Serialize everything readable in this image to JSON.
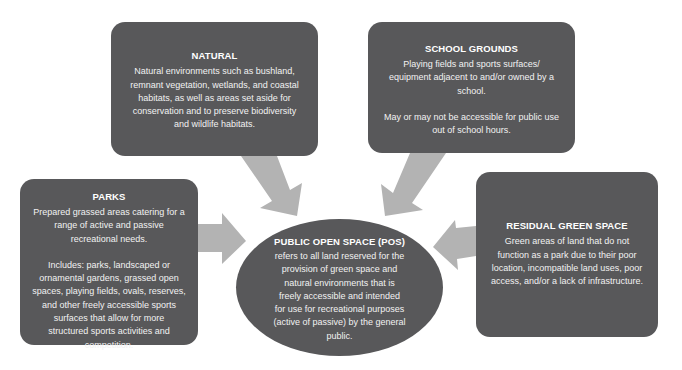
{
  "diagram": {
    "center": {
      "title": "PUBLIC OPEN SPACE (POS)",
      "text": "refers to all land reserved for the\nprovision of green space and\nnatural environments that is\nfreely accessible and intended\nfor use for recreational purposes\n(active of passive) by the general\npublic."
    },
    "natural": {
      "title": "NATURAL",
      "text": "Natural environments such as bushland,\nremnant vegetation, wetlands, and coastal\nhabitats, as well as areas set aside for\nconservation and to preserve biodiversity\nand wildlife habitats."
    },
    "school_grounds": {
      "title": "SCHOOL GROUNDS",
      "text": "Playing fields and sports surfaces/\nequipment adjacent to and/or owned by a\nschool.",
      "note": "May or may not be accessible for public use\nout of school hours."
    },
    "parks": {
      "title": "PARKS",
      "text": "Prepared grassed areas catering for a\nrange of active and passive\nrecreational needs.",
      "note": "Includes: parks, landscaped or\nornamental gardens, grassed open\nspaces, playing fields, ovals, reserves,\nand other freely accessible sports\nsurfaces that allow for more\nstructured sports activities and\ncompetition."
    },
    "residual_green_space": {
      "title": "RESIDUAL GREEN SPACE",
      "text": "Green areas of land that do not\nfunction as a park due to their poor\nlocation, incompatible land uses, poor\naccess, and/or a lack of infrastructure."
    },
    "arrows": [
      {
        "from": "natural",
        "to": "center"
      },
      {
        "from": "school_grounds",
        "to": "center"
      },
      {
        "from": "parks",
        "to": "center"
      },
      {
        "from": "residual_green_space",
        "to": "center"
      }
    ],
    "colors": {
      "box_fill": "#58585a",
      "arrow_fill": "#b3b3b3",
      "text": "#f2f2f2",
      "background": "#ffffff"
    }
  }
}
